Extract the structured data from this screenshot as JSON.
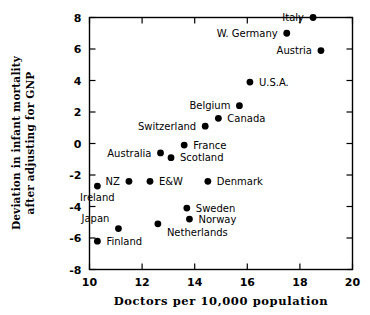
{
  "chart_data": {
    "type": "scatter",
    "title": "",
    "xlabel": "Doctors  per  10,000  population",
    "ylabel_line1": "Deviation in infant mortality",
    "ylabel_line2": "after adjusting for GNP",
    "xlim": [
      10,
      20
    ],
    "ylim": [
      -8,
      8
    ],
    "xticks": [
      10,
      12,
      14,
      16,
      18,
      20
    ],
    "yticks": [
      8,
      6,
      4,
      2,
      0,
      -2,
      -4,
      -6,
      -8
    ],
    "xticklabels": [
      "10",
      "12",
      "14",
      "16",
      "18",
      "20"
    ],
    "yticklabels": [
      "8",
      "6",
      "4",
      "2",
      "0",
      "-2",
      "-4",
      "-6",
      "-8"
    ],
    "grid": false,
    "legend": null,
    "marker_color": "#000000",
    "marker_shape": "circle",
    "points": [
      {
        "label": "Italy",
        "x": 18.5,
        "y": 8.0,
        "label_pos": "left"
      },
      {
        "label": "W. Germany",
        "x": 17.5,
        "y": 7.0,
        "label_pos": "left"
      },
      {
        "label": "Austria",
        "x": 18.8,
        "y": 5.9,
        "label_pos": "left"
      },
      {
        "label": "U.S.A.",
        "x": 16.1,
        "y": 3.9,
        "label_pos": "right"
      },
      {
        "label": "Belgium",
        "x": 15.7,
        "y": 2.4,
        "label_pos": "left"
      },
      {
        "label": "Canada",
        "x": 14.9,
        "y": 1.6,
        "label_pos": "right"
      },
      {
        "label": "Switzerland",
        "x": 14.4,
        "y": 1.1,
        "label_pos": "left"
      },
      {
        "label": "France",
        "x": 13.6,
        "y": -0.1,
        "label_pos": "right"
      },
      {
        "label": "Scotland",
        "x": 13.1,
        "y": -0.9,
        "label_pos": "right"
      },
      {
        "label": "Australia",
        "x": 12.7,
        "y": -0.6,
        "label_pos": "left"
      },
      {
        "label": "NZ",
        "x": 11.5,
        "y": -2.4,
        "label_pos": "left"
      },
      {
        "label": "E&W",
        "x": 12.3,
        "y": -2.4,
        "label_pos": "right"
      },
      {
        "label": "Denmark",
        "x": 14.5,
        "y": -2.4,
        "label_pos": "right"
      },
      {
        "label": "Ireland",
        "x": 10.3,
        "y": -2.7,
        "label_pos": "below"
      },
      {
        "label": "Sweden",
        "x": 13.7,
        "y": -4.1,
        "label_pos": "right"
      },
      {
        "label": "Norway",
        "x": 13.8,
        "y": -4.8,
        "label_pos": "right"
      },
      {
        "label": "Netherlands",
        "x": 12.6,
        "y": -5.1,
        "label_pos": "below-right"
      },
      {
        "label": "Japan",
        "x": 11.1,
        "y": -5.4,
        "label_pos": "upper-left"
      },
      {
        "label": "Finland",
        "x": 10.3,
        "y": -6.2,
        "label_pos": "right"
      }
    ]
  },
  "axes": {
    "x_title": "Doctors  per  10,000  population",
    "y_title_line1": "Deviation in infant mortality",
    "y_title_line2": "after adjusting for GNP"
  }
}
